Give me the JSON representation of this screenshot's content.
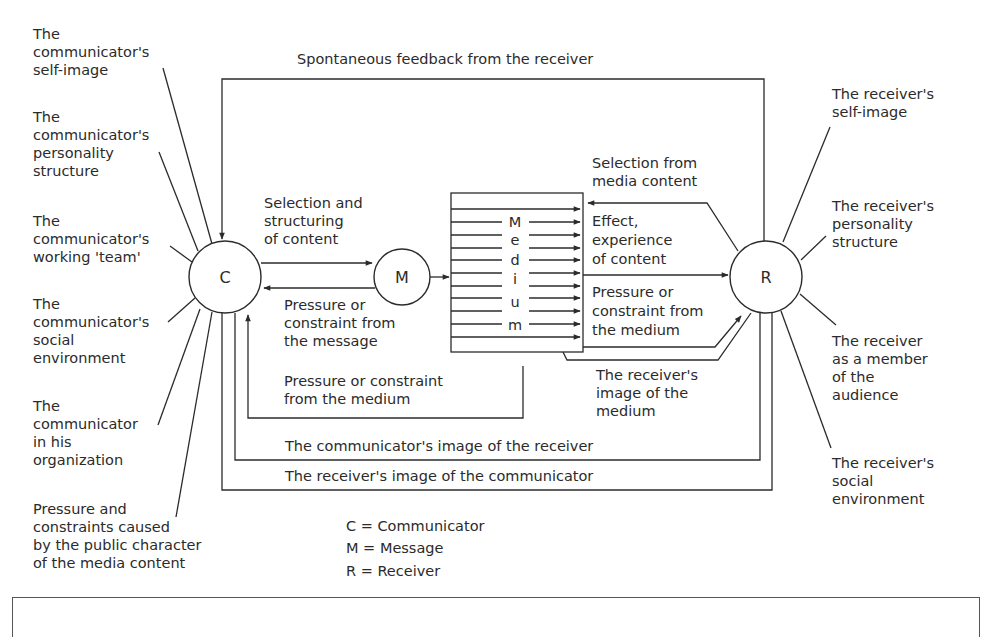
{
  "nodes": {
    "communicator": "C",
    "message": "M",
    "receiver": "R"
  },
  "top_feedback_label": "Spontaneous feedback from the receiver",
  "communicator_factors": [
    [
      "The",
      "communicator's",
      "self-image"
    ],
    [
      "The",
      "communicator's",
      "personality",
      "structure"
    ],
    [
      "The",
      "communicator's",
      "working 'team'"
    ],
    [
      "The",
      "communicator's",
      "social",
      "environment"
    ],
    [
      "The",
      "communicator",
      "in his",
      "organization"
    ],
    [
      "Pressure and",
      "constraints caused",
      "by the public character",
      "of the media content"
    ]
  ],
  "receiver_factors": [
    [
      "The receiver's",
      "self-image"
    ],
    [
      "The receiver's",
      "personality",
      "structure"
    ],
    [
      "The receiver",
      "as a member",
      "of the",
      "audience"
    ],
    [
      "The receiver's",
      "social",
      "environment"
    ]
  ],
  "flows": {
    "selection_structuring": [
      "Selection and",
      "structuring",
      "of content"
    ],
    "pressure_message": [
      "Pressure or",
      "constraint from",
      "the message"
    ],
    "pressure_medium_to_c": [
      "Pressure or constraint",
      "from the medium"
    ],
    "selection_media": [
      "Selection from",
      "media content"
    ],
    "effect_experience": [
      "Effect,",
      "experience",
      "of content"
    ],
    "pressure_medium_to_r": [
      "Pressure or",
      "constraint from",
      "the medium"
    ],
    "receiver_image_medium": [
      "The receiver's",
      "image of the",
      "medium"
    ],
    "communicator_image_receiver": "The communicator's image of the receiver",
    "receiver_image_communicator": "The receiver's image of the communicator"
  },
  "medium_letters": [
    "M",
    "e",
    "d",
    "i",
    "u",
    "m"
  ],
  "legend": [
    "C = Communicator",
    "M = Message",
    "R = Receiver"
  ]
}
